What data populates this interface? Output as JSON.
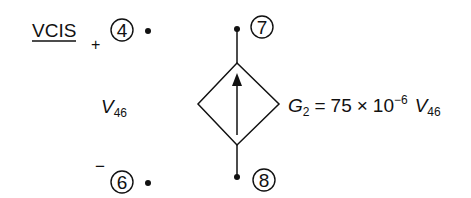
{
  "title": "VCIS",
  "input_port": {
    "positive_sign": "+",
    "negative_sign": "−",
    "positive_node": "4",
    "negative_node": "6",
    "voltage_label": {
      "main": "V",
      "sub": "46"
    }
  },
  "output_port": {
    "top_node": "7",
    "bottom_node": "8",
    "source_type": "dependent current source (diamond, arrow up)"
  },
  "equation": {
    "lhs_main": "G",
    "lhs_sub": "2",
    "equals": "=",
    "coefficient": "75",
    "times": "×",
    "base": "10",
    "exponent": "−6",
    "var_main": "V",
    "var_sub": "46"
  }
}
